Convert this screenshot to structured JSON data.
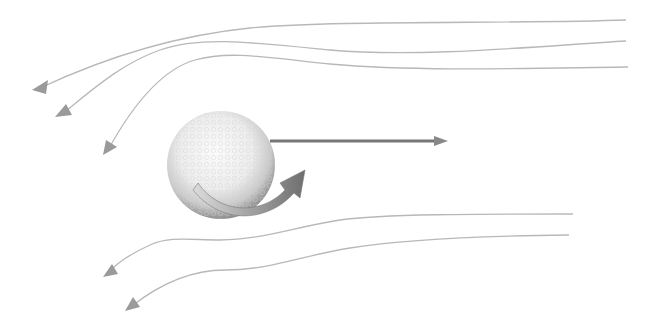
{
  "diagram": {
    "colors": {
      "background": "#ffffff",
      "streamline": "#b8b8b8",
      "arrowhead": "#9a9a9a",
      "velocity_arrow": "#777777",
      "ball_light": "#f7f7f7",
      "ball_mid": "#d8d8d8",
      "ball_dark": "#8e8e8e",
      "spin_arrow_light": "#d0d0d0",
      "spin_arrow_dark": "#6e6e6e"
    },
    "ball": {
      "cx": 221,
      "cy": 165,
      "r": 54
    },
    "velocity_arrow": {
      "x1": 270,
      "y1": 141,
      "x2": 448,
      "y2": 141
    },
    "streamlines": [
      {
        "name": "streamline-top-1",
        "d": "M626,20 C520,24 330,20 250,28 C170,36 100,60 40,88",
        "head": "32,90 48,80 46,94"
      },
      {
        "name": "streamline-top-2",
        "d": "M626,41 C540,46 420,58 330,50 C250,42 200,36 160,50 C120,64 90,92 62,114",
        "head": "55,117 66,104 72,115"
      },
      {
        "name": "streamline-top-3",
        "d": "M628,67 C540,68 420,72 330,64 C270,58 230,50 195,60 C160,70 130,110 108,150",
        "head": "103,155 106,140 117,147"
      },
      {
        "name": "streamline-bottom-1",
        "d": "M573,214 C480,214 380,214 340,220 C290,228 260,240 220,240 C190,240 170,236 150,245 C130,254 115,265 108,273",
        "head": "103,277 112,264 118,274"
      },
      {
        "name": "streamline-bottom-2",
        "d": "M569,235 C480,236 400,240 350,248 C300,256 270,270 225,270 C190,270 160,284 132,306",
        "head": "125,311 133,297 140,307"
      }
    ],
    "spin_arrow": {
      "body": "M198,183 C220,215 262,215 285,190 L280,183 L305,170 L300,198 L294,193 C268,222 222,226 193,190 Z"
    }
  }
}
